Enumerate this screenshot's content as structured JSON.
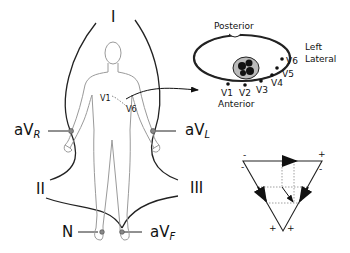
{
  "diagram": {
    "limb_leads": {
      "lead_I": "I",
      "lead_II": "II",
      "lead_III": "III",
      "aVR": {
        "base": "aV",
        "sub": "R"
      },
      "aVL": {
        "base": "aV",
        "sub": "L"
      },
      "aVF": {
        "base": "aV",
        "sub": "F"
      },
      "neutral": "N"
    },
    "chest_electrodes": {
      "v1": "V1",
      "v6": "V6"
    },
    "cross_section": {
      "posterior": "Posterior",
      "anterior": "Anterior",
      "left": "Left",
      "lateral": "Lateral",
      "electrodes": [
        "V1",
        "V2",
        "V3",
        "V4",
        "V5",
        "V6"
      ]
    },
    "einthoven_triangle": {
      "top_left_minus": "-",
      "top_right_plus": "+",
      "left_side_minus": "-",
      "right_side_minus": "-",
      "bottom_left_plus": "+",
      "bottom_right_plus": "+"
    },
    "colors": {
      "line": "#222222",
      "body_outline": "#9a9a9a",
      "dotted": "#888888"
    }
  }
}
